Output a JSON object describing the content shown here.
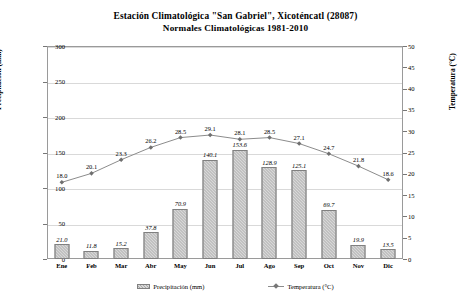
{
  "chart_data": {
    "type": "bar",
    "title": "Estación Climatológica \"San Gabriel\", Xicoténcatl (28087)",
    "subtitle": "Normales Climatológicas 1981-2010",
    "categories": [
      "Ene",
      "Feb",
      "Mar",
      "Abr",
      "May",
      "Jun",
      "Jul",
      "Ago",
      "Sep",
      "Oct",
      "Nov",
      "Dic"
    ],
    "series": [
      {
        "name": "Precipitación (mm)",
        "type": "bar",
        "axis": "left",
        "values": [
          21.0,
          11.8,
          15.2,
          37.8,
          70.9,
          140.1,
          153.6,
          128.9,
          125.1,
          69.7,
          19.9,
          13.5
        ],
        "labels": [
          "21.0",
          "11.8",
          "15.2",
          "37.8",
          "70.9",
          "140.1",
          "153.6",
          "128.9",
          "125.1",
          "69.7",
          "19.9",
          "13.5"
        ],
        "color": "#a9a9a9"
      },
      {
        "name": "Temperatura (°C)",
        "type": "line",
        "axis": "right",
        "values": [
          18.0,
          20.1,
          23.3,
          26.2,
          28.5,
          29.1,
          28.1,
          28.5,
          27.1,
          24.7,
          21.8,
          18.6
        ],
        "labels": [
          "18.0",
          "20.1",
          "23.3",
          "26.2",
          "28.5",
          "29.1",
          "28.1",
          "28.5",
          "27.1",
          "24.7",
          "21.8",
          "18.6"
        ],
        "color": "#8c8c8c"
      }
    ],
    "xlabel": "",
    "ylabel": "Precipitación (mm)",
    "y2label": "Temperatura (°C)",
    "ylim": [
      0,
      300
    ],
    "y2lim": [
      0,
      50
    ],
    "yticks": [
      "0",
      "50",
      "100",
      "150",
      "200",
      "250",
      "300"
    ],
    "y2ticks": [
      "0",
      "5",
      "10",
      "15",
      "20",
      "25",
      "30",
      "35",
      "40",
      "45",
      "50"
    ],
    "grid": true,
    "legend_position": "bottom",
    "legend": [
      "Precipitación (mm)",
      "Temperatura (°C)"
    ]
  }
}
